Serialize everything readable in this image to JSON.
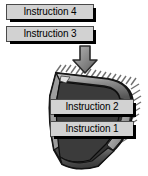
{
  "diagram": {
    "background_color": "#ffffff",
    "labels": {
      "instruction_4": "Instruction 4",
      "instruction_3": "Instruction 3",
      "instruction_2": "Instruction 2",
      "instruction_1": "Instruction 1"
    },
    "label_style": {
      "fill_color": "#d2d2d2",
      "border_color": "#4a4a4a",
      "text_color": "#000000",
      "shadow_color": "#000000"
    },
    "arrow": {
      "icon": "down-arrow-icon",
      "direction": "down",
      "color": "#7d7d7d",
      "outline_color": "#2b2b2b"
    },
    "chip": {
      "icon": "processor-chip-icon",
      "body_color": "#4d4d4d",
      "top_face_color": "#9a9a9a",
      "side_face_color": "#2e2e2e",
      "highlight_color": "#c8c8c8",
      "pin_color": "#6f6f6f",
      "outline_color": "#111111",
      "pin_count_top": 16,
      "pin_count_right": 9
    }
  }
}
